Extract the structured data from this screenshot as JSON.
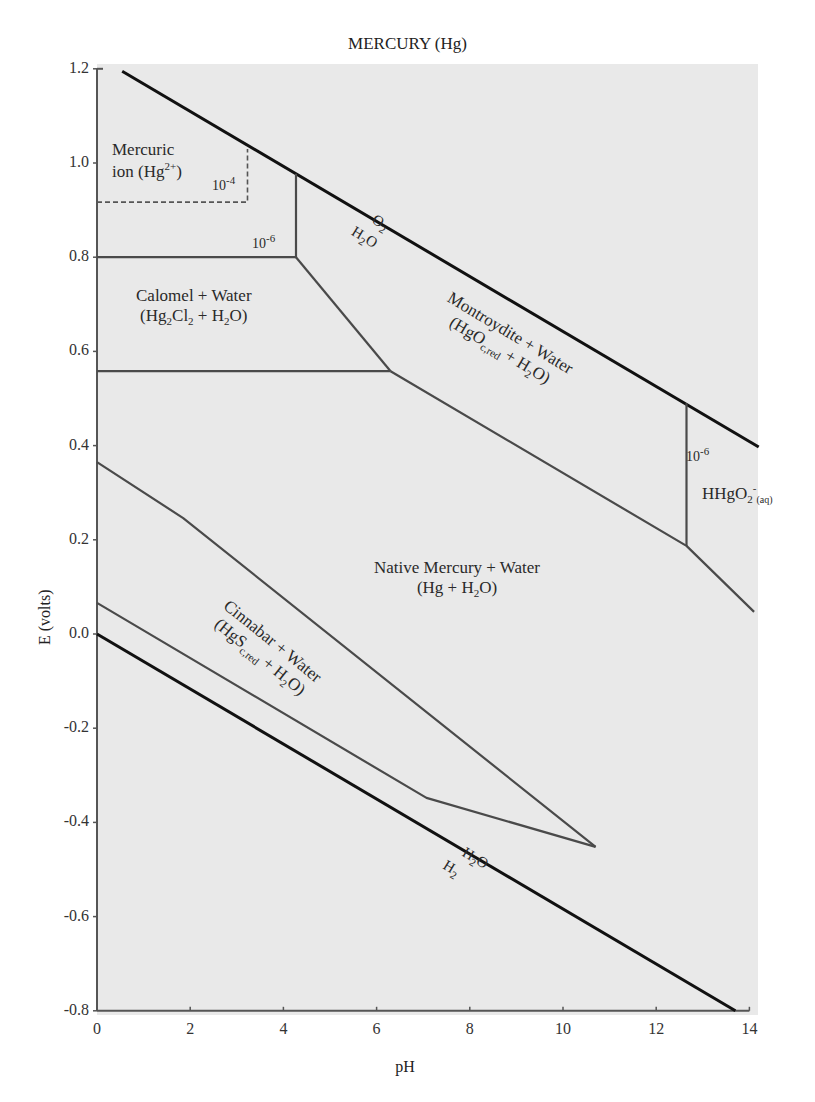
{
  "chart_data": {
    "type": "line",
    "title": "MERCURY (Hg)",
    "xlabel": "pH",
    "ylabel": "E (volts)",
    "xlim": [
      0,
      14
    ],
    "ylim": [
      -0.8,
      1.2
    ],
    "x_ticks": [
      "0",
      "2",
      "4",
      "6",
      "8",
      "10",
      "12",
      "14"
    ],
    "y_ticks": [
      "1.2",
      "1.0",
      "0.8",
      "0.6",
      "0.4",
      "0.2",
      "0.0",
      "-0.2",
      "-0.4",
      "-0.6",
      "-0.8"
    ],
    "grid": false,
    "background": "#e9e9e9",
    "series": [
      {
        "name": "O2/H2O stability line",
        "style": "thick-black",
        "points": [
          [
            0.54,
            1.195
          ],
          [
            14.2,
            0.397
          ]
        ]
      },
      {
        "name": "H2O/H2 stability line",
        "style": "thick-black",
        "points": [
          [
            0.0,
            0.0
          ],
          [
            13.7,
            -0.8
          ]
        ]
      },
      {
        "name": "Hg2+ boundary 10^-4 (dashed)",
        "style": "dashed",
        "points": [
          [
            0.0,
            0.917
          ],
          [
            3.23,
            0.917
          ],
          [
            3.23,
            1.03
          ]
        ]
      },
      {
        "name": "Hg2+ / Calomel boundary (10^-6)",
        "style": "gray",
        "points": [
          [
            0.0,
            0.8
          ],
          [
            4.27,
            0.8
          ],
          [
            4.27,
            0.977
          ]
        ]
      },
      {
        "name": "Calomel / Montroydite boundary",
        "style": "gray",
        "points": [
          [
            4.27,
            0.8
          ],
          [
            6.3,
            0.558
          ]
        ]
      },
      {
        "name": "Calomel / Native Mercury boundary",
        "style": "gray",
        "points": [
          [
            0.0,
            0.558
          ],
          [
            6.3,
            0.558
          ]
        ]
      },
      {
        "name": "Montroydite / Native Mercury boundary",
        "style": "gray",
        "points": [
          [
            6.3,
            0.558
          ],
          [
            12.65,
            0.187
          ],
          [
            14.1,
            0.047
          ]
        ]
      },
      {
        "name": "Montroydite / HHgO2- boundary (10^-6)",
        "style": "gray",
        "points": [
          [
            12.65,
            0.187
          ],
          [
            12.65,
            0.49
          ]
        ]
      },
      {
        "name": "Cinnabar upper boundary",
        "style": "gray",
        "points": [
          [
            0.0,
            0.365
          ],
          [
            1.85,
            0.246
          ],
          [
            10.7,
            -0.452
          ]
        ]
      },
      {
        "name": "Cinnabar lower boundary",
        "style": "gray",
        "points": [
          [
            0.0,
            0.066
          ],
          [
            7.07,
            -0.348
          ],
          [
            10.7,
            -0.452
          ]
        ]
      }
    ],
    "annotations": [
      {
        "text": "Mercuric ion (Hg2+)",
        "x": 0.8,
        "y": 0.97
      },
      {
        "text": "10^-4",
        "x": 2.6,
        "y": 0.94
      },
      {
        "text": "10^-6",
        "x": 3.4,
        "y": 0.82
      },
      {
        "text": "Calomel + Water (Hg2Cl2 + H2O)",
        "x": 1.9,
        "y": 0.68
      },
      {
        "text": "O2 / H2O",
        "x": 5.6,
        "y": 0.88
      },
      {
        "text": "Montroydite + Water (HgOc,red + H2O)",
        "x": 9.5,
        "y": 0.62
      },
      {
        "text": "10^-6",
        "x": 12.8,
        "y": 0.38
      },
      {
        "text": "HHgO2- (aq)",
        "x": 13.6,
        "y": 0.28
      },
      {
        "text": "Native Mercury + Water (Hg + H2O)",
        "x": 7.8,
        "y": 0.18
      },
      {
        "text": "Cinnabar + Water (HgSc,red + H2O)",
        "x": 3.7,
        "y": -0.05
      },
      {
        "text": "H2O / H2",
        "x": 8.2,
        "y": -0.52
      }
    ]
  },
  "labels": {
    "title": "MERCURY (Hg)",
    "xlabel": "pH",
    "ylabel": "E (volts)",
    "mercuric_1": "Mercuric",
    "mercuric_2": "ion (Hg",
    "mercuric_sup": "2+",
    "conc_4": "10",
    "conc_4_sup": "-4",
    "conc_6": "10",
    "conc_6_sup": "-6",
    "calomel_1": "Calomel + Water",
    "calomel_2a": "(Hg",
    "calomel_2b": "Cl",
    "calomel_2c": " + H",
    "calomel_2d": "O)",
    "o2": "O",
    "h2o_top": "H",
    "montroydite_1": "Montroydite + Water",
    "montroydite_2a": "(HgO",
    "montroydite_2sub": "c,red",
    "montroydite_2b": " + H",
    "montroydite_2c": "O)",
    "conc_6b": "10",
    "conc_6b_sup": "-6",
    "hhgo2": "HHgO",
    "hhgo2_sup": "-",
    "hhgo2_sub": "(aq)",
    "native_1": "Native Mercury + Water",
    "native_2a": "(Hg + H",
    "native_2b": "O)",
    "cinnabar_1": "Cinnabar + Water",
    "cinnabar_2a": "(HgS",
    "cinnabar_2sub": "c,red",
    "cinnabar_2b": " + H",
    "cinnabar_2c": "O)",
    "h2o_bottom": "H",
    "h2": "H",
    "two": "2"
  }
}
